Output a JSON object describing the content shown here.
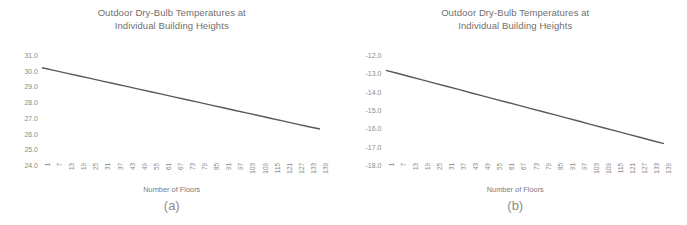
{
  "figure": {
    "background_color": "#ffffff",
    "text_color": "#7b7b7b",
    "line_color": "#595959"
  },
  "panels": [
    {
      "caption": "(a)",
      "title_line1": "Outdoor Dry-Bulb Temperatures at",
      "title_line2": "Individual Building Heights"
    },
    {
      "caption": "(b)",
      "title_line1": "Outdoor Dry-Bulb Temperatures at",
      "title_line2": "Individual Building Heights"
    }
  ],
  "chart_data": [
    {
      "type": "line",
      "panel": "(a)",
      "title": "Outdoor Dry-Bulb Temperatures at Individual Building Heights",
      "xlabel": "Number of Floors",
      "ylabel": "",
      "grid": false,
      "legend": "none",
      "ylim": [
        24.0,
        31.0
      ],
      "yticks": [
        "31.0",
        "30.0",
        "29.0",
        "28.0",
        "27.0",
        "26.0",
        "25.0",
        "24.0"
      ],
      "ytick_values": [
        31.0,
        30.0,
        29.0,
        28.0,
        27.0,
        26.0,
        25.0,
        24.0
      ],
      "xticks": [
        "1",
        "7",
        "13",
        "19",
        "25",
        "31",
        "37",
        "43",
        "49",
        "55",
        "61",
        "67",
        "73",
        "79",
        "85",
        "91",
        "97",
        "103",
        "109",
        "115",
        "121",
        "127",
        "133",
        "139"
      ],
      "x": [
        1,
        7,
        13,
        19,
        25,
        31,
        37,
        43,
        49,
        55,
        61,
        67,
        73,
        79,
        85,
        91,
        97,
        103,
        109,
        115,
        121,
        127,
        133,
        139
      ],
      "values": [
        30.0,
        29.83,
        29.66,
        29.49,
        29.32,
        29.15,
        28.98,
        28.81,
        28.64,
        28.47,
        28.3,
        28.13,
        27.96,
        27.79,
        27.62,
        27.45,
        27.28,
        27.11,
        26.94,
        26.77,
        26.6,
        26.43,
        26.26,
        26.1
      ]
    },
    {
      "type": "line",
      "panel": "(b)",
      "title": "Outdoor Dry-Bulb Temperatures at Individual Building Heights",
      "xlabel": "Number of Floors",
      "ylabel": "",
      "grid": false,
      "legend": "none",
      "ylim": [
        -18.0,
        -12.0
      ],
      "yticks": [
        "-12.0",
        "-13.0",
        "-14.0",
        "-15.0",
        "-16.0",
        "-17.0",
        "-18.0"
      ],
      "ytick_values": [
        -12.0,
        -13.0,
        -14.0,
        -15.0,
        -16.0,
        -17.0,
        -18.0
      ],
      "xticks": [
        "1",
        "7",
        "13",
        "19",
        "25",
        "31",
        "37",
        "43",
        "49",
        "55",
        "61",
        "67",
        "73",
        "79",
        "85",
        "91",
        "97",
        "103",
        "109",
        "115",
        "121",
        "127",
        "133",
        "139"
      ],
      "x": [
        1,
        7,
        13,
        19,
        25,
        31,
        37,
        43,
        49,
        55,
        61,
        67,
        73,
        79,
        85,
        91,
        97,
        103,
        109,
        115,
        121,
        127,
        133,
        139
      ],
      "values": [
        -13.0,
        -13.17,
        -13.35,
        -13.52,
        -13.7,
        -13.87,
        -14.04,
        -14.22,
        -14.39,
        -14.57,
        -14.74,
        -14.91,
        -15.09,
        -15.26,
        -15.43,
        -15.61,
        -15.78,
        -15.96,
        -16.13,
        -16.3,
        -16.48,
        -16.65,
        -16.83,
        -17.0
      ]
    }
  ]
}
